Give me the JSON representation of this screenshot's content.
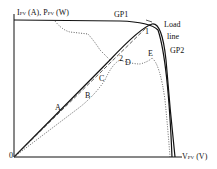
{
  "diagram": {
    "y_axis_label_prefix": "I",
    "y_axis_label_sub": "PV",
    "y_axis_label_mid": " (A),  P",
    "y_axis_label_sub2": "PV",
    "y_axis_label_suffix": " (W)",
    "x_axis_label_prefix": "V",
    "x_axis_label_sub": "PV",
    "x_axis_label_suffix": " (V)",
    "origin": "0",
    "labels": {
      "gp1": "GP1",
      "gp2": "GP2",
      "load_line_1": "Load",
      "load_line_2": "line",
      "a": "A",
      "b": "B",
      "c": "C",
      "d": "D",
      "e": "E",
      "one": "1",
      "two": "2"
    }
  }
}
